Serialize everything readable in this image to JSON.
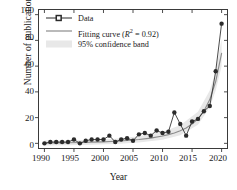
{
  "chart_data": {
    "type": "line",
    "title": "",
    "xlabel": "Year",
    "ylabel": "Number of publications",
    "xlim": [
      1989,
      2021
    ],
    "ylim": [
      -4,
      104
    ],
    "xticks": [
      1990,
      1995,
      2000,
      2005,
      2010,
      2015,
      2020
    ],
    "yticks": [
      0,
      20,
      40,
      60,
      80,
      100
    ],
    "grid": false,
    "legend_position": "top-left",
    "series": [
      {
        "name": "Data",
        "type": "line-markers",
        "color": "#2b2b2b",
        "x": [
          1990,
          1991,
          1992,
          1993,
          1994,
          1995,
          1996,
          1997,
          1998,
          1999,
          2000,
          2001,
          2002,
          2003,
          2004,
          2005,
          2006,
          2007,
          2008,
          2009,
          2010,
          2011,
          2012,
          2013,
          2014,
          2015,
          2016,
          2017,
          2018,
          2019,
          2020
        ],
        "values": [
          0,
          1,
          1,
          1,
          1,
          3,
          0,
          2,
          3,
          3,
          3,
          6,
          1,
          3,
          4,
          2,
          7,
          8,
          6,
          10,
          8,
          9,
          24,
          15,
          6,
          17,
          19,
          25,
          29,
          56,
          93
        ]
      },
      {
        "name": "Fitting curve",
        "type": "line",
        "color": "#8c8c8c",
        "x": [
          1990,
          1992,
          1994,
          1996,
          1998,
          2000,
          2002,
          2004,
          2006,
          2008,
          2010,
          2011,
          2012,
          2013,
          2014,
          2015,
          2016,
          2017,
          2018,
          2019,
          2020
        ],
        "values": [
          0.3,
          0.4,
          0.5,
          0.7,
          0.9,
          1.2,
          1.6,
          2.2,
          3.0,
          4.1,
          5.7,
          6.8,
          8.1,
          9.8,
          12.0,
          15.0,
          19.0,
          25.0,
          34.0,
          48.0,
          70.0
        ]
      },
      {
        "name": "95% confidence band",
        "type": "band",
        "color": "#e8e8e8",
        "x": [
          1990,
          1994,
          1998,
          2002,
          2006,
          2010,
          2013,
          2016,
          2018,
          2019,
          2020
        ],
        "lower": [
          -1.6,
          -1.4,
          -1.1,
          -0.6,
          0.6,
          2.8,
          6.2,
          14.5,
          28.0,
          41.0,
          60.0
        ],
        "upper": [
          2.2,
          2.3,
          2.6,
          3.6,
          5.6,
          9.0,
          14.0,
          24.5,
          41.0,
          56.0,
          81.0
        ]
      }
    ]
  },
  "axes": {
    "y_title": "Number of publications",
    "x_title": "Year",
    "y_tick_labels": [
      "100",
      "80",
      "60",
      "40",
      "20",
      "0"
    ],
    "x_tick_labels": [
      "1990",
      "1995",
      "2000",
      "2005",
      "2010",
      "2015",
      "2020"
    ]
  },
  "legend": {
    "data_label": "Data",
    "fit_label_pre": "Fitting curve (",
    "fit_label_r": "R",
    "fit_label_sup": "2",
    "fit_label_post": " = 0.92)",
    "band_label": "95% confidence band"
  },
  "colors": {
    "marker": "#2b2b2b",
    "data_line": "#2b2b2b",
    "fit_line": "#8c8c8c",
    "band": "#e8e8e8",
    "axis": "#3a3a3a",
    "background": "#ffffff"
  }
}
